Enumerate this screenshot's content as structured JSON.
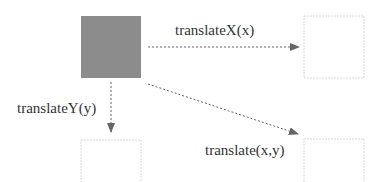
{
  "diagram": {
    "colors": {
      "original_fill": "#8c8c8c",
      "ghost_border": "#d8d8d8",
      "arrow": "#666666",
      "text": "#333333"
    },
    "boxes": [
      {
        "id": "original",
        "label": "",
        "style": "filled"
      },
      {
        "id": "translated-x",
        "label": "",
        "style": "dotted"
      },
      {
        "id": "translated-y",
        "label": "",
        "style": "dotted"
      },
      {
        "id": "translated-xy",
        "label": "",
        "style": "dotted"
      }
    ],
    "arrows": [
      {
        "from": "original",
        "to": "translated-x",
        "label": "translateX(x)"
      },
      {
        "from": "original",
        "to": "translated-y",
        "label": "translateY(y)"
      },
      {
        "from": "original",
        "to": "translated-xy",
        "label": "translate(x,y)"
      }
    ]
  }
}
